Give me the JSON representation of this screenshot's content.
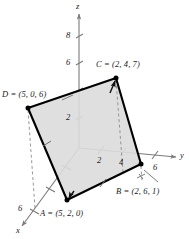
{
  "figure": {
    "background_color": "#ffffff",
    "face_fill_color": "#dcdcdc",
    "edge_color": "#000000",
    "axis_color": "#7a7a7a",
    "dashed_color": "#8c8c8c",
    "text_color": "#1a1a1a"
  },
  "axes": {
    "z": {
      "name": "z",
      "ticks": [
        {
          "label": "2"
        },
        {
          "label": "6"
        },
        {
          "label": "8"
        }
      ]
    },
    "y": {
      "name": "y",
      "ticks": [
        {
          "label": "2"
        },
        {
          "label": "4"
        },
        {
          "label": "6"
        }
      ]
    },
    "x": {
      "name": "x",
      "ticks": [
        {
          "label": "6"
        }
      ]
    }
  },
  "points": [
    {
      "id": "C",
      "label": "C = (2, 4, 7)",
      "coords": [
        2,
        4,
        7
      ]
    },
    {
      "id": "D",
      "label": "D = (5, 0, 6)",
      "coords": [
        5,
        0,
        6
      ]
    },
    {
      "id": "B",
      "label": "B = (2, 6, 1)",
      "coords": [
        2,
        6,
        1
      ]
    },
    {
      "id": "A",
      "label": "A = (5, 2, 0)",
      "coords": [
        5,
        2,
        0
      ]
    }
  ]
}
